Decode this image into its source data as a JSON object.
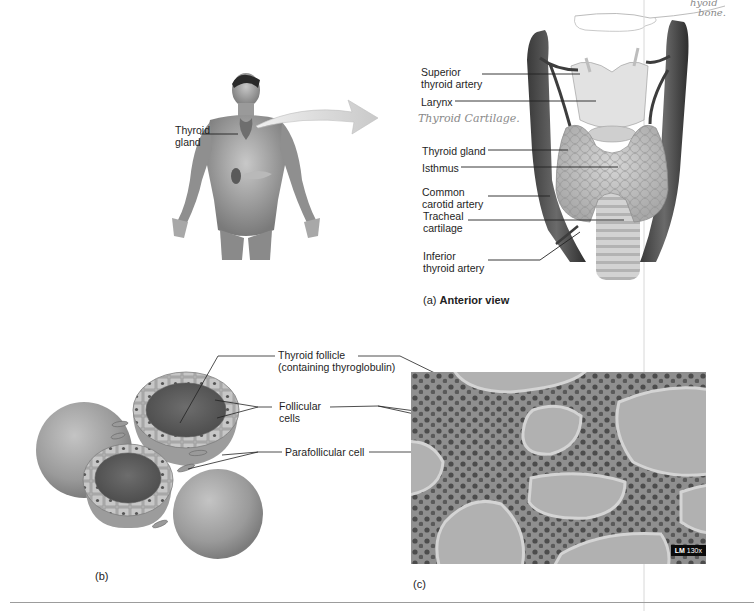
{
  "figure": {
    "panel_a": {
      "body_label": "Thyroid gland",
      "labels": [
        "Superior\nthyroid artery",
        "Larynx",
        "Thyroid gland",
        "Isthmus",
        "Common\ncarotid artery",
        "Tracheal\ncartilage",
        "Inferior\nthyroid artery"
      ],
      "label_lines": {
        "superior_1": "Superior",
        "superior_2": "thyroid artery",
        "larynx": "Larynx",
        "thyroid_gland": "Thyroid gland",
        "isthmus": "Isthmus",
        "common_1": "Common",
        "common_2": "carotid artery",
        "tracheal_1": "Tracheal",
        "tracheal_2": "cartilage",
        "inferior_1": "Inferior",
        "inferior_2": "thyroid artery",
        "body_1": "Thyroid",
        "body_2": "gland"
      },
      "handwritten": {
        "thyroid_cartilage": "Thyroid Cartilage.",
        "hyoid_1": "hyoid",
        "hyoid_2": "bone."
      },
      "caption_prefix": "(a)",
      "caption_title": "Anterior view"
    },
    "panel_b": {
      "caption": "(b)"
    },
    "panel_c": {
      "caption": "(c)",
      "magnification_prefix": "LM",
      "magnification_value": "130x"
    },
    "shared_labels": {
      "follicle_1": "Thyroid follicle",
      "follicle_2": "(containing thyroglobulin)",
      "follicular_1": "Follicular",
      "follicular_2": "cells",
      "parafollicular": "Parafollicular cell"
    }
  }
}
